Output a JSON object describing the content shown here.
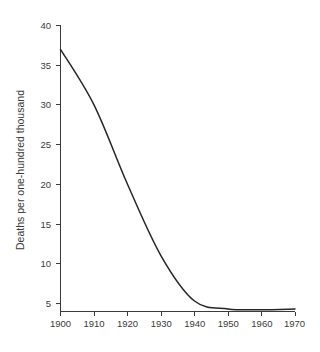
{
  "chart_data": {
    "type": "line",
    "title": "",
    "subtitle": "",
    "xlabel": "",
    "ylabel": "Deaths per one-hundred thousand",
    "x": [
      1900,
      1910,
      1920,
      1930,
      1940,
      1950,
      1960,
      1970
    ],
    "values": [
      37,
      30,
      20,
      11,
      5.3,
      4.3,
      4.2,
      4.3
    ],
    "series": [
      {
        "name": "Deaths per one-hundred thousand",
        "values": [
          37,
          30,
          20,
          11,
          5.3,
          4.3,
          4.2,
          4.3
        ]
      }
    ],
    "xlim": [
      1900,
      1970
    ],
    "ylim": [
      4,
      40
    ],
    "x_ticks": [
      1900,
      1910,
      1920,
      1930,
      1940,
      1950,
      1960,
      1970
    ],
    "x_tick_labels": [
      "1900",
      "1910",
      "1920",
      "1930",
      "1940",
      "1950",
      "1960",
      "1970"
    ],
    "y_ticks": [
      5,
      10,
      15,
      20,
      25,
      30,
      35,
      40
    ],
    "y_tick_labels": [
      "5",
      "10",
      "15",
      "20",
      "25",
      "30",
      "35",
      "40"
    ],
    "grid": false,
    "legend": false,
    "legend_position": "none",
    "line_color": "#262626",
    "background_color": "#ffffff",
    "axis_color": "#3b3b3b"
  },
  "axis": {
    "y_title": "Deaths per one-hundred thousand"
  },
  "ticks": {
    "x": {
      "t0": "1900",
      "t1": "1910",
      "t2": "1920",
      "t3": "1930",
      "t4": "1940",
      "t5": "1950",
      "t6": "1960",
      "t7": "1970"
    },
    "y": {
      "t0": "5",
      "t1": "10",
      "t2": "15",
      "t3": "20",
      "t4": "25",
      "t5": "30",
      "t6": "35",
      "t7": "40"
    }
  }
}
